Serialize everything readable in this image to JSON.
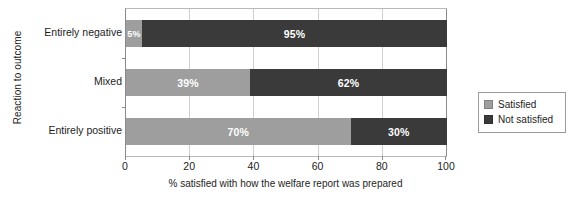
{
  "chart_data": {
    "type": "bar",
    "orientation": "horizontal",
    "stacked": true,
    "title": "",
    "xlabel": "% satisfied with how the welfare report was prepared",
    "ylabel": "Reaction to outcome",
    "categories": [
      "Entirely negative",
      "Mixed",
      "Entirely positive"
    ],
    "series": [
      {
        "name": "Satisfied",
        "color": "#9e9e9e",
        "values": [
          5,
          39,
          70
        ],
        "labels": [
          "5%",
          "39%",
          "70%"
        ]
      },
      {
        "name": "Not satisfied",
        "color": "#3a3a3a",
        "values": [
          95,
          62,
          30
        ],
        "labels": [
          "95%",
          "62%",
          "30%"
        ]
      }
    ],
    "xlim": [
      0,
      100
    ],
    "xticks": [
      0,
      20,
      40,
      60,
      80,
      100
    ],
    "xtick_labels": [
      "0",
      "20",
      "40",
      "60",
      "80",
      "100"
    ],
    "grid": true,
    "grid_axis": "x",
    "legend_position": "right"
  },
  "axes": {
    "y_title": "Reaction to outcome",
    "x_title": "% satisfied with how the welfare report was prepared"
  },
  "legend": {
    "items": [
      {
        "label": "Satisfied",
        "color": "#9e9e9e"
      },
      {
        "label": "Not satisfied",
        "color": "#3a3a3a"
      }
    ]
  },
  "colors": {
    "satisfied": "#9e9e9e",
    "not_satisfied": "#3a3a3a",
    "gridline": "#cfcfcf",
    "axis": "#8a8a8a",
    "text": "#1d1d1d",
    "background": "#ffffff"
  }
}
